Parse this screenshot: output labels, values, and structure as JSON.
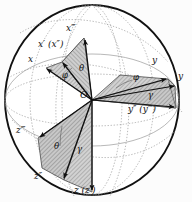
{
  "figure": {
    "name": "euler-angle-rotation-sphere",
    "background": "#fcfcfc",
    "sphere": {
      "outline_color": "#111111",
      "grid_color": "#9a9a9a",
      "center_x": 92,
      "center_y": 100,
      "radius_x": 88,
      "radius_y": 96
    },
    "style": {
      "vector_color": "#1a1a1a",
      "wedge_fill": "#b9b9b9",
      "wedge_edge": "#3a3a3a",
      "dotted_color": "#8c8c8c"
    },
    "origin_label": "O",
    "axis_labels": {
      "x": "x",
      "x_prime": "x′ (x″)",
      "x_triple": "x‴",
      "y": "y",
      "y_tip": "y",
      "y_double": "y″ (y‴)",
      "z": "z (z′)",
      "z_double": "z″",
      "z_triple": "z‴"
    },
    "angle_labels": {
      "phi_upper_left": "φ",
      "theta_upper_left": "θ",
      "phi_right": "φ",
      "gamma_right": "γ",
      "theta_lower_left": "θ",
      "gamma_lower_left": "γ"
    }
  }
}
